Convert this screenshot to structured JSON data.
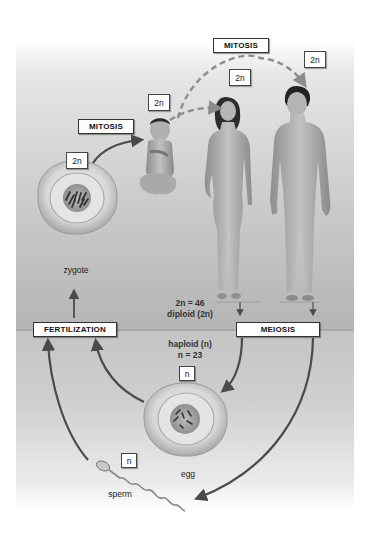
{
  "diagram": {
    "process_labels": {
      "mitosis_top": "MITOSIS",
      "mitosis_left": "MITOSIS",
      "fertilization": "FERTILIZATION",
      "meiosis": "MEIOSIS"
    },
    "ploidy_badges": {
      "zygote": "2n",
      "baby": "2n",
      "female": "2n",
      "male": "2n",
      "egg": "n",
      "sperm": "n"
    },
    "cell_labels": {
      "zygote": "zygote",
      "egg": "egg",
      "sperm": "sperm"
    },
    "diploid_text": {
      "line1": "2n = 46",
      "line2": "diploid (2n)"
    },
    "haploid_text": {
      "line1": "haploid (n)",
      "line2": "n = 23"
    },
    "colors": {
      "arrow": "#4a4a4a",
      "dashed_arrow": "#8c8c8c",
      "diploid_zone_top": "#e6e6e6",
      "diploid_zone_bottom": "#b4b4b4",
      "haploid_zone": "#cfcfcf",
      "cell_outer": "#d9d9d9",
      "nucleus": "#a8a8a8",
      "skin": "#b8b8b8"
    }
  }
}
